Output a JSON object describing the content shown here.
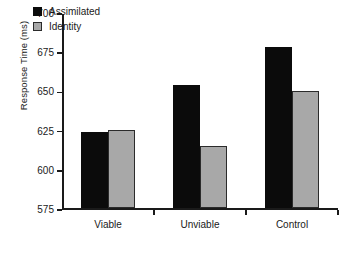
{
  "chart_data": {
    "type": "bar",
    "title": "",
    "xlabel": "",
    "ylabel": "Response Time (ms)",
    "categories": [
      "Viable",
      "Unviable",
      "Control"
    ],
    "series": [
      {
        "name": "Assimilated",
        "color": "#0b0b0b",
        "values": [
          624,
          654,
          678
        ]
      },
      {
        "name": "Identity",
        "color": "#a8a8a8",
        "values": [
          625,
          615,
          650
        ]
      }
    ],
    "ylim": [
      575,
      700
    ],
    "ytick_values": [
      575,
      600,
      625,
      650,
      675,
      700
    ],
    "ytick_labels": [
      "575",
      "600",
      "625",
      "650",
      "675",
      "700"
    ],
    "grid": false,
    "legend_position": "top-left-inside"
  },
  "legend": {
    "items": [
      {
        "label": "Assimilated",
        "swatch": "black-square-icon"
      },
      {
        "label": "Identity",
        "swatch": "gray-square-icon"
      }
    ]
  }
}
